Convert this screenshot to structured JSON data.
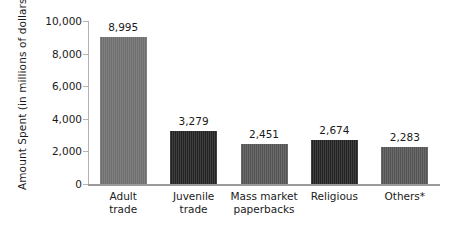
{
  "chart_data": {
    "type": "bar",
    "title": "",
    "xlabel": "",
    "ylabel": "Amount Spent (in millions of dollars)",
    "ylim": [
      0,
      10000
    ],
    "ytick_labels": [
      "10,000",
      "8,000",
      "6,000",
      "4,000",
      "2,000",
      "0"
    ],
    "ytick_values": [
      10000,
      8000,
      6000,
      4000,
      2000,
      0
    ],
    "grid": false,
    "legend": null,
    "categories": [
      "Adult trade",
      "Juvenile trade",
      "Mass market paperbacks",
      "Religious",
      "Others*"
    ],
    "category_lines": [
      [
        "Adult",
        "trade"
      ],
      [
        "Juvenile",
        "trade"
      ],
      [
        "Mass market",
        "paperbacks"
      ],
      [
        "Religious"
      ],
      [
        "Others*"
      ]
    ],
    "values": [
      8995,
      3279,
      2451,
      2674,
      2283
    ],
    "value_labels": [
      "8,995",
      "3,279",
      "2,451",
      "2,674",
      "2,283"
    ],
    "bar_colors": [
      "#6e6e6e",
      "#232323",
      "#545454",
      "#232323",
      "#545454"
    ]
  },
  "axis": {
    "axis_line_color": "#b4b4b4",
    "baseline_color": "#9a9a9a"
  },
  "footnote": {
    "edge_sliver": ""
  }
}
